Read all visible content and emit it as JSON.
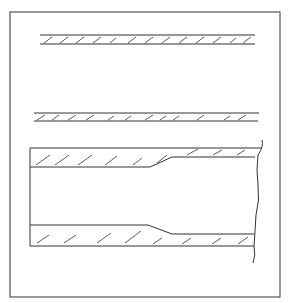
{
  "figure": {
    "stroke_color": "#333333",
    "background": "#ffffff",
    "elements": [
      {
        "name": "thin-wall-section-1",
        "type": "hatched-strip"
      },
      {
        "name": "thin-wall-section-2",
        "type": "hatched-strip"
      },
      {
        "name": "pipe-section-with-taper",
        "type": "longitudinal-section",
        "break_line": "wavy"
      }
    ]
  }
}
